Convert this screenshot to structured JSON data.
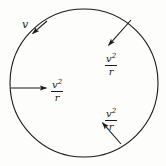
{
  "figure": {
    "background_color": "#fdfdfc",
    "stroke_color": "#1a1a1a",
    "circle": {
      "center_x": 84,
      "center_y": 83,
      "radius": 74,
      "stroke_width": 1.1
    },
    "labels": {
      "velocity": {
        "text": "v",
        "meaning": "tangential-velocity"
      },
      "acceleration_numerator": "v",
      "acceleration_exponent": "2",
      "acceleration_denominator": "r",
      "acceleration_text": "v²/r",
      "acceleration_meaning": "centripetal-acceleration-magnitude"
    },
    "vectors": [
      {
        "name": "velocity-tangent-arrow",
        "label": "v",
        "direction": "tangential",
        "x1": 47,
        "y1": 21,
        "x2": 31,
        "y2": 35
      },
      {
        "name": "acceleration-arrow-left",
        "label": "v²/r",
        "direction": "radial-inward",
        "x1": 11,
        "y1": 88,
        "x2": 48,
        "y2": 88
      },
      {
        "name": "acceleration-arrow-upper-right",
        "label": "v²/r",
        "direction": "radial-inward",
        "x1": 131,
        "y1": 20,
        "x2": 107,
        "y2": 47
      },
      {
        "name": "acceleration-arrow-lower-right",
        "label": "v²/r",
        "direction": "radial-inward",
        "x1": 121,
        "y1": 144,
        "x2": 101,
        "y2": 121
      }
    ]
  }
}
